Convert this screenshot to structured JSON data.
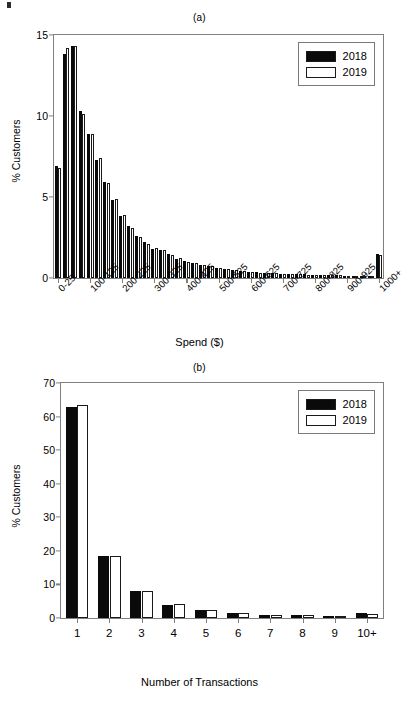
{
  "figure": {
    "panel_a_label": "(a)",
    "panel_b_label": "(b)"
  },
  "legend": {
    "series": [
      {
        "name": "2018",
        "color": "#0a0a0a",
        "swatch": "filled-black"
      },
      {
        "name": "2019",
        "color": "#ffffff",
        "swatch": "outline-white"
      }
    ]
  },
  "chart_data": [
    {
      "type": "bar",
      "title": "(a)",
      "xlabel": "Spend ($)",
      "ylabel": "% Customers",
      "ylim": [
        0,
        15
      ],
      "yticks": [
        0,
        5,
        10,
        15
      ],
      "grid": false,
      "legend_position": "top-right",
      "categories": [
        "0-25",
        "25-50",
        "50-75",
        "75-100",
        "100-125",
        "125-150",
        "150-175",
        "175-200",
        "200-225",
        "225-250",
        "250-275",
        "275-300",
        "300-325",
        "325-350",
        "350-375",
        "375-400",
        "400-425",
        "425-450",
        "450-475",
        "475-500",
        "500-525",
        "525-550",
        "550-575",
        "575-600",
        "600-625",
        "625-650",
        "650-675",
        "675-700",
        "700-725",
        "725-750",
        "750-775",
        "775-800",
        "800-825",
        "825-850",
        "850-875",
        "875-900",
        "900-925",
        "925-950",
        "950-975",
        "975-1000",
        "1000+"
      ],
      "xtick_labels": [
        "0-25",
        "100-125",
        "200-225",
        "300-325",
        "400-425",
        "500-525",
        "600-625",
        "700-725",
        "800-825",
        "900-925",
        "1000+"
      ],
      "xtick_indices": [
        0,
        4,
        8,
        12,
        16,
        20,
        24,
        28,
        32,
        36,
        40
      ],
      "series": [
        {
          "name": "2018",
          "values": [
            6.9,
            13.8,
            14.3,
            10.3,
            8.9,
            7.3,
            5.9,
            4.8,
            3.8,
            3.2,
            2.6,
            2.2,
            1.8,
            1.7,
            1.5,
            1.2,
            1.05,
            0.95,
            0.8,
            0.75,
            0.62,
            0.55,
            0.5,
            0.45,
            0.4,
            0.35,
            0.32,
            0.3,
            0.27,
            0.25,
            0.24,
            0.22,
            0.2,
            0.19,
            0.18,
            0.17,
            0.15,
            0.14,
            0.13,
            0.12,
            1.5
          ]
        },
        {
          "name": "2019",
          "values": [
            6.8,
            14.2,
            14.3,
            10.1,
            8.9,
            7.4,
            5.85,
            4.9,
            3.9,
            3.1,
            2.55,
            2.1,
            1.85,
            1.7,
            1.45,
            1.25,
            1.0,
            0.9,
            0.82,
            0.72,
            0.6,
            0.54,
            0.48,
            0.44,
            0.38,
            0.34,
            0.31,
            0.29,
            0.26,
            0.25,
            0.23,
            0.21,
            0.2,
            0.18,
            0.17,
            0.16,
            0.14,
            0.13,
            0.12,
            0.11,
            1.45
          ]
        }
      ]
    },
    {
      "type": "bar",
      "title": "(b)",
      "xlabel": "Number of Transactions",
      "ylabel": "% Customers",
      "ylim": [
        0,
        70
      ],
      "yticks": [
        0,
        10,
        20,
        30,
        40,
        50,
        60,
        70
      ],
      "grid": false,
      "legend_position": "top-right",
      "categories": [
        "1",
        "2",
        "3",
        "4",
        "5",
        "6",
        "7",
        "8",
        "9",
        "10+"
      ],
      "xtick_labels": [
        "1",
        "2",
        "3",
        "4",
        "5",
        "6",
        "7",
        "8",
        "9",
        "10+"
      ],
      "series": [
        {
          "name": "2018",
          "values": [
            62.8,
            18.5,
            8.0,
            4.0,
            2.3,
            1.4,
            1.0,
            0.8,
            0.6,
            1.4
          ]
        },
        {
          "name": "2019",
          "values": [
            63.4,
            18.4,
            8.0,
            4.05,
            2.3,
            1.35,
            1.0,
            0.8,
            0.6,
            1.3
          ]
        }
      ]
    }
  ]
}
